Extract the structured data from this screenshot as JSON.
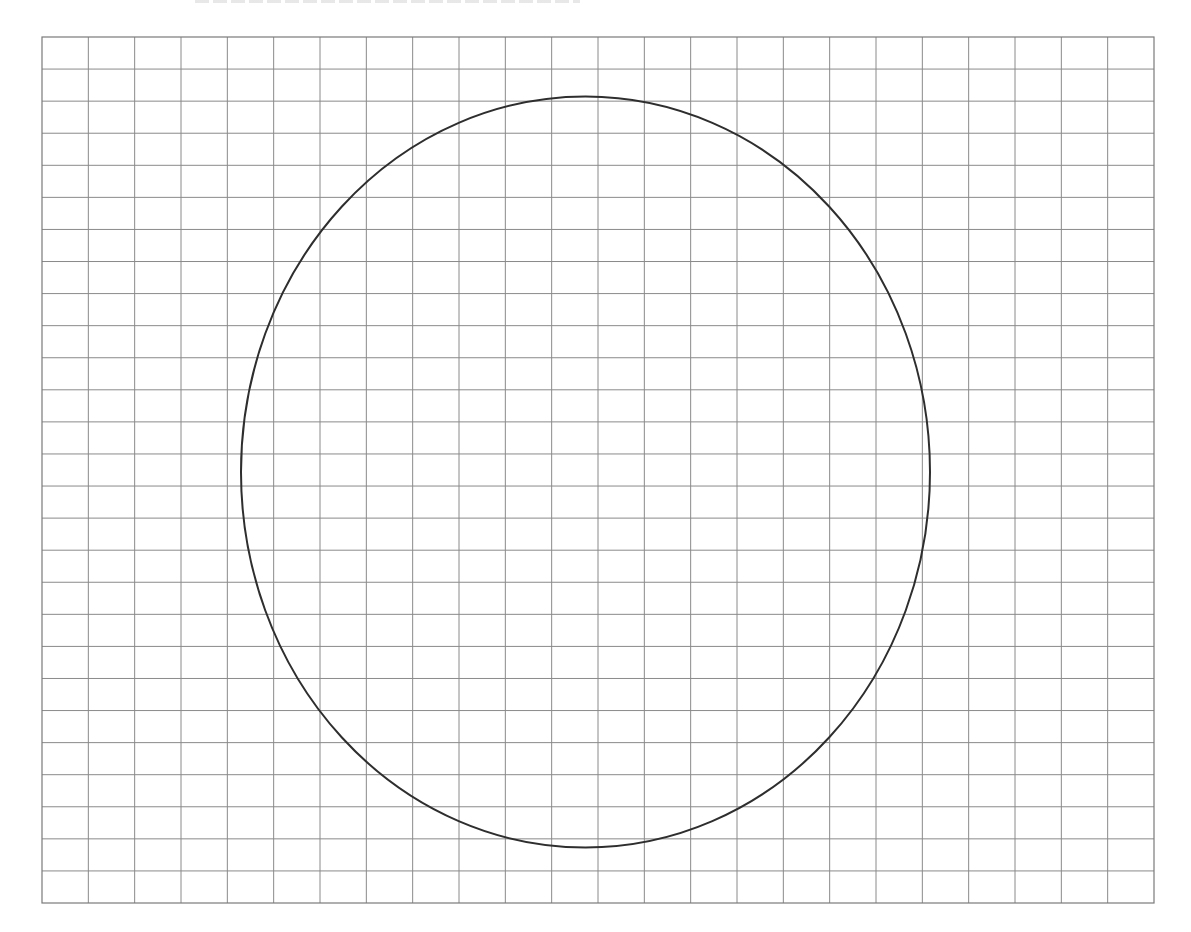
{
  "diagram": {
    "type": "grid-with-ellipse",
    "grid": {
      "x": 42,
      "y": 37,
      "width": 1112,
      "height": 866,
      "columns": 24,
      "rows": 27,
      "line_color": "#8a8a8a",
      "border_color": "#7a7a7a"
    },
    "ellipse": {
      "cx": 585.5,
      "cy": 472,
      "rx": 344.5,
      "ry": 375.5,
      "stroke": "#2e2e2e",
      "stroke_width": 2
    }
  }
}
